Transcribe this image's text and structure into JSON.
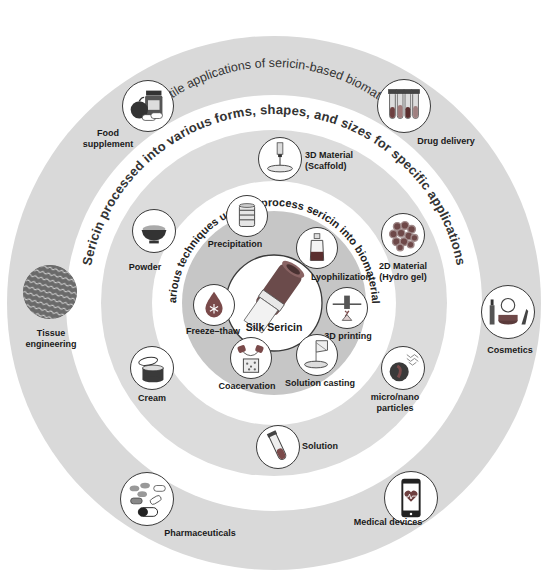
{
  "figure": {
    "outer_ring_title": "Versatile applications of sericin-based biomaterials",
    "middle_ring_title": "Sericin processed into various forms, shapes, and sizes for specific applications",
    "inner_ring_title": "Various techniques used to process sericin into biomaterials",
    "center": {
      "label": "Silk Sericin",
      "icon": "silk-cocoon-fiber-icon"
    }
  },
  "applications": [
    {
      "label_line1": "Food",
      "label_line2": "supplement",
      "icon": "apple-supplement-jar-icon"
    },
    {
      "label_line1": "Drug delivery",
      "label_line2": "",
      "icon": "test-tubes-icon"
    },
    {
      "label_line1": "Tissue",
      "label_line2": "engineering",
      "icon": "woven-mesh-icon"
    },
    {
      "label_line1": "Cosmetics",
      "label_line2": "",
      "icon": "makeup-compact-icon"
    },
    {
      "label_line1": "Pharmaceuticals",
      "label_line2": "",
      "icon": "pills-capsules-icon"
    },
    {
      "label_line1": "Medical devices",
      "label_line2": "",
      "icon": "smartphone-heart-icon"
    }
  ],
  "forms": [
    {
      "label_line1": "3D Material",
      "label_line2": "(Scaffold)",
      "icon": "scaffold-dish-icon"
    },
    {
      "label_line1": "2D Material",
      "label_line2": "(Hydro gel)",
      "icon": "hydrogel-beads-icon"
    },
    {
      "label_line1": "micro/nano",
      "label_line2": "particles",
      "icon": "particle-sphere-icon"
    },
    {
      "label_line1": "Solution",
      "label_line2": "",
      "icon": "test-tube-icon"
    },
    {
      "label_line1": "Cream",
      "label_line2": "",
      "icon": "cream-jar-icon"
    },
    {
      "label_line1": "Powder",
      "label_line2": "",
      "icon": "powder-bowl-icon"
    }
  ],
  "techniques": [
    {
      "label": "Precipitation",
      "icon": "precipitation-beaker-icon"
    },
    {
      "label": "Lyophilization",
      "icon": "bottle-icon"
    },
    {
      "label": "3D printing",
      "icon": "3d-printer-nozzle-icon"
    },
    {
      "label": "Solution casting",
      "icon": "casting-pour-icon"
    },
    {
      "label": "Coacervation",
      "icon": "coacervation-icon"
    },
    {
      "label": "Freeze–thaw",
      "icon": "freeze-drop-icon"
    }
  ],
  "colors": {
    "ring_gray": "#d9d9d9",
    "inner_gray": "#c4c4c4",
    "band_white": "#ffffff",
    "icon_dark": "#3b3b3b",
    "icon_red": "#7a4a4a",
    "text": "#1a1a1a"
  }
}
